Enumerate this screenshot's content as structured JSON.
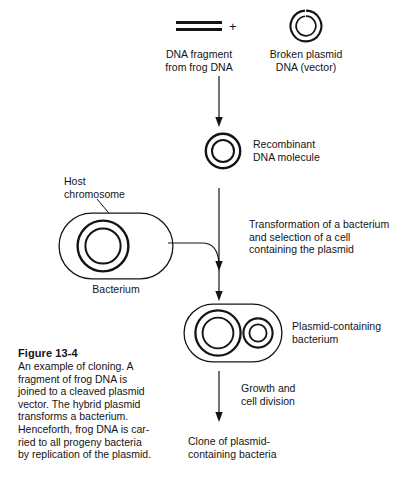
{
  "figure": {
    "caption_title": "Figure 13-4",
    "caption_body": "An example of cloning. A\nfragment of frog DNA is\njoined to a cleaved plasmid\nvector. The hybrid plasmid\ntransforms a bacterium.\nHenceforth, frog DNA is car-\nried to all progeny bacteria\nby replication of the plasmid."
  },
  "operators": {
    "plus": "+"
  },
  "labels": {
    "dna_fragment": "DNA fragment\nfrom frog DNA",
    "broken_plasmid": "Broken plasmid\nDNA (vector)",
    "recombinant": "Recombinant\nDNA molecule",
    "host_chromosome": "Host\nchromosome",
    "bacterium": "Bacterium",
    "transformation": "Transformation of a bacterium\nand selection of a cell\ncontaining the plasmid",
    "plasmid_containing_bacterium": "Plasmid-containing\nbacterium",
    "growth": "Growth and\ncell division",
    "clone": "Clone of plasmid-\ncontaining bacteria"
  },
  "icons": {
    "dna_fragment": "dna-fragment-icon",
    "broken_plasmid": "broken-plasmid-icon",
    "recombinant_plasmid": "recombinant-dna-ring-icon",
    "bacterium": "bacterium-cell-icon",
    "host_chromosome": "host-chromosome-ring-icon",
    "plasmid_ring": "plasmid-ring-icon",
    "arrow_down": "arrow-down-icon",
    "arrow_elbow": "arrow-elbow-icon",
    "leader_line": "leader-line-icon"
  },
  "colors": {
    "ink": "#141414",
    "background": "#ffffff"
  }
}
